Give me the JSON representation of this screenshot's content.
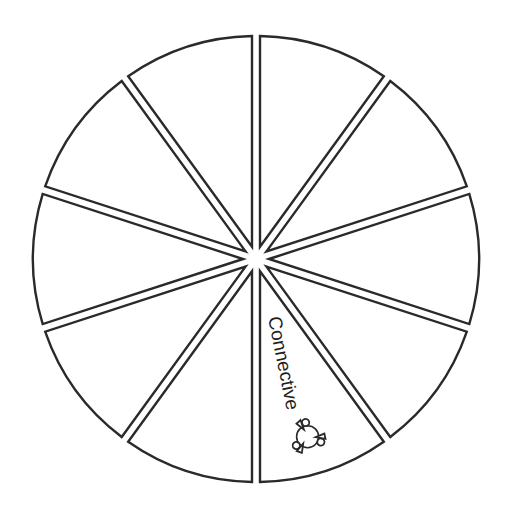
{
  "diagram": {
    "type": "segmented-wheel",
    "segment_count": 10,
    "center": [
      256,
      259
    ],
    "radius": 223,
    "gap": 8,
    "colors": {
      "stroke": "#2a2a2a",
      "fill": "#ffffff",
      "text": "#1e1e1e"
    },
    "segments": [
      {
        "index": 0,
        "label": ""
      },
      {
        "index": 1,
        "label": ""
      },
      {
        "index": 2,
        "label": ""
      },
      {
        "index": 3,
        "label": ""
      },
      {
        "index": 4,
        "label": "Connective",
        "icon": "people-network-icon"
      },
      {
        "index": 5,
        "label": ""
      },
      {
        "index": 6,
        "label": ""
      },
      {
        "index": 7,
        "label": ""
      },
      {
        "index": 8,
        "label": ""
      },
      {
        "index": 9,
        "label": ""
      }
    ]
  }
}
